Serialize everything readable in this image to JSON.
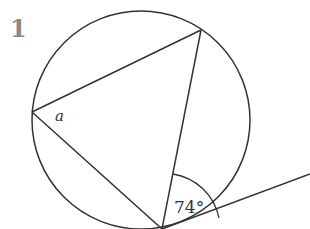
{
  "question_number": "1",
  "diagram": {
    "type": "circle theorem - alternate segment",
    "circle": {
      "cx": 141,
      "cy": 120,
      "r": 109
    },
    "points": {
      "A": [
        32,
        112
      ],
      "B": [
        201,
        30
      ],
      "C": [
        162,
        229
      ]
    },
    "tangent_end": [
      310,
      174
    ],
    "labels": {
      "angle_a": "a",
      "angle_given": "74°"
    },
    "colors": {
      "stroke": "#333333",
      "number": "#8a8a8a"
    }
  }
}
